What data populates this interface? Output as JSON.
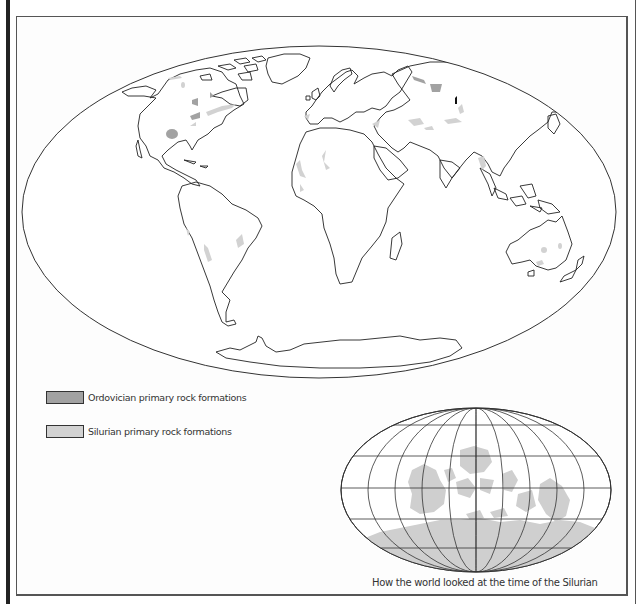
{
  "map": {
    "title": "World map of Ordovician and Silurian primary rock formations",
    "projection": "Mollweide",
    "colors": {
      "coastline": "#222222",
      "ordovician": "#a2a2a2",
      "silurian": "#d2d2d2",
      "background": "#fdfdfd"
    }
  },
  "legend": {
    "items": [
      {
        "label": "Ordovician primary rock formations",
        "color": "#a2a2a2"
      },
      {
        "label": "Silurian primary rock formations",
        "color": "#d2d2d2"
      }
    ]
  },
  "inset": {
    "caption": "How the world looked at the time of the Silurian",
    "land_color": "#cfcfcf"
  }
}
